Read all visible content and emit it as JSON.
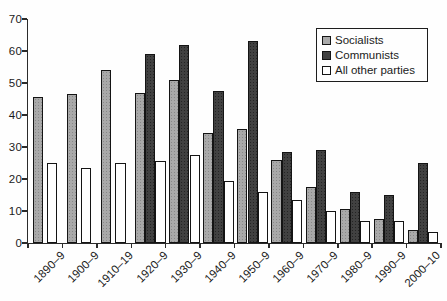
{
  "figure": {
    "background": "#fefefe",
    "axis_color": "#2b2b2b",
    "text_color": "#1b1b1b"
  },
  "legend": {
    "position": "top-right",
    "items": [
      {
        "label": "Socialists",
        "swatch": "gray-stipple-square"
      },
      {
        "label": "Communists",
        "swatch": "dark-stipple-square"
      },
      {
        "label": "All other parties",
        "swatch": "white-square"
      }
    ]
  },
  "chart_data": {
    "type": "bar",
    "categories": [
      "1890–9",
      "1900–9",
      "1910–19",
      "1920–9",
      "1930–9",
      "1940–9",
      "1950–9",
      "1960–9",
      "1970–9",
      "1980–9",
      "1990–9",
      "2000–10"
    ],
    "series": [
      {
        "name": "Socialists",
        "color": "#a9a9a9",
        "values": [
          45.5,
          46.5,
          54,
          47,
          51,
          34.5,
          35.5,
          26,
          17.5,
          10.5,
          7.5,
          4
        ]
      },
      {
        "name": "Communists",
        "color": "#414141",
        "values": [
          null,
          null,
          null,
          59,
          62,
          47.5,
          63,
          28.5,
          29,
          16,
          15,
          25
        ]
      },
      {
        "name": "All other parties",
        "color": "#ffffff",
        "values": [
          25,
          23.5,
          25,
          25.5,
          27.5,
          19.5,
          16,
          13.5,
          10,
          7,
          7,
          3.5
        ]
      }
    ],
    "xlabel": "",
    "ylabel": "",
    "ylim": [
      0,
      70
    ],
    "yticks": [
      0,
      10,
      20,
      30,
      40,
      50,
      60,
      70
    ],
    "grid": false,
    "legend_position": "top-right"
  }
}
